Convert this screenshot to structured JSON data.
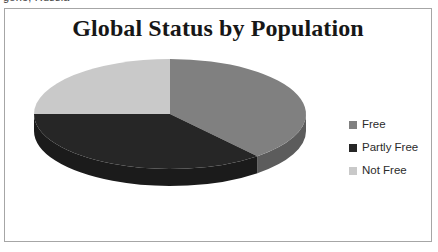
{
  "page": {
    "clipped_text_above": "gone, Russia"
  },
  "chart": {
    "title": "Global Status by Population",
    "frame_border_color": "#a6a6a6",
    "background_color": "#ffffff"
  },
  "legend": {
    "position": "right",
    "items": [
      {
        "label": "Free",
        "color": "#808080"
      },
      {
        "label": "Partly Free",
        "color": "#262626"
      },
      {
        "label": "Not Free",
        "color": "#c9c9c9"
      }
    ]
  },
  "chart_data": {
    "type": "pie",
    "title": "Global Status by Population",
    "subtitle": "",
    "xlabel": "",
    "ylabel": "",
    "three_d": true,
    "start_angle_deg": 0,
    "direction": "clockwise",
    "legend_position": "right",
    "grid": false,
    "labels": [
      "Free",
      "Partly Free",
      "Not Free"
    ],
    "values": [
      39,
      36,
      25
    ],
    "units": "percent",
    "colors": [
      "#808080",
      "#262626",
      "#c9c9c9"
    ],
    "slices": [
      {
        "label": "Free",
        "value": 39,
        "color": "#808080",
        "start_deg": 0,
        "end_deg": 140
      },
      {
        "label": "Partly Free",
        "value": 36,
        "color": "#262626",
        "start_deg": 140,
        "end_deg": 270
      },
      {
        "label": "Not Free",
        "value": 25,
        "color": "#c9c9c9",
        "start_deg": 270,
        "end_deg": 360
      }
    ],
    "geometry": {
      "center_x": 165,
      "center_y": 105,
      "radius_x": 136,
      "radius_y": 55,
      "depth": 17
    }
  }
}
